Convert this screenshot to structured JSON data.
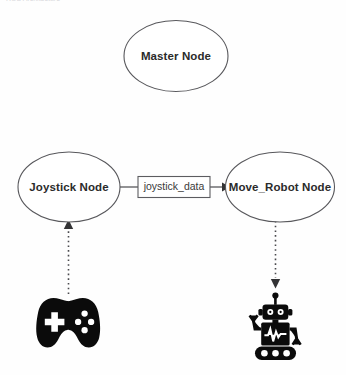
{
  "header": {
    "clipped_text": "ROS Architecture"
  },
  "diagram": {
    "background_color": "#fefefe",
    "line_color": "#4a4a4e",
    "icon_color": "#0b0b0b",
    "nodes": [
      {
        "id": "master",
        "label": "Master Node",
        "shape": "ellipse",
        "cx": 176,
        "cy": 56,
        "rx": 52,
        "ry": 35.5
      },
      {
        "id": "joystick",
        "label": "Joystick Node",
        "shape": "ellipse",
        "cx": 69,
        "cy": 187,
        "rx": 51,
        "ry": 35
      },
      {
        "id": "move_robot",
        "label": "Move_Robot Node",
        "shape": "ellipse",
        "cx": 280,
        "cy": 187,
        "rx": 54.5,
        "ry": 35
      }
    ],
    "topic": {
      "id": "joystick_data",
      "label": "joystick_data",
      "shape": "rectangle",
      "x": 138,
      "y": 176,
      "width": 72,
      "height": 21
    },
    "edges": [
      {
        "id": "joystick-to-topic",
        "from": "joystick",
        "to": "joystick_data",
        "style": "solid",
        "arrow": false
      },
      {
        "id": "topic-to-move-robot",
        "from": "joystick_data",
        "to": "move_robot",
        "style": "solid",
        "arrow": true,
        "direction": "right"
      },
      {
        "id": "gamepad-to-joystick",
        "from": "gamepad-icon",
        "to": "joystick",
        "style": "dotted",
        "arrow": true,
        "direction": "up"
      },
      {
        "id": "move-robot-to-robot",
        "from": "move_robot",
        "to": "robot-icon",
        "style": "dotted",
        "arrow": true,
        "direction": "down"
      }
    ],
    "icons": [
      {
        "id": "gamepad",
        "name": "gamepad-icon",
        "description": "game controller",
        "cx": 68,
        "cy": 323
      },
      {
        "id": "robot",
        "name": "robot-icon",
        "description": "robot with treads",
        "cx": 275,
        "cy": 320
      }
    ]
  }
}
